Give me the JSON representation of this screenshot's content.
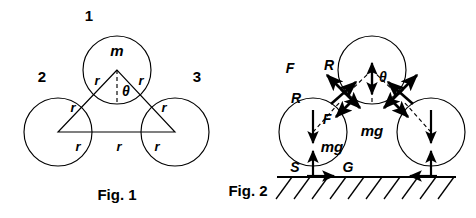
{
  "page": {
    "width": 476,
    "height": 218,
    "background": "#ffffff",
    "ink": "#000000"
  },
  "figure1": {
    "caption": "Fig. 1",
    "circle_labels": {
      "top": "1",
      "left": "2",
      "right": "3"
    },
    "mass_label": "m",
    "angle_label": "θ",
    "radius_labels": {
      "upper_left": "r",
      "upper_right": "r",
      "left_side": "r",
      "right_side": "r",
      "base_left": "r",
      "base_mid": "r",
      "base_right": "r"
    },
    "geometry": {
      "circle_radius": 34,
      "top_circle_center": [
        117,
        70
      ],
      "left_circle_center": [
        58,
        132
      ],
      "right_circle_center": [
        175,
        132
      ],
      "triangle_vertices": [
        [
          117,
          70
        ],
        [
          58,
          132
        ],
        [
          175,
          132
        ]
      ]
    }
  },
  "figure2": {
    "caption": "Fig. 2",
    "angle_label": "θ",
    "force_labels": {
      "friction_outer": "F",
      "reaction_outer": "R",
      "reaction_inner": "R",
      "friction_inner": "F",
      "weight_top": "mg",
      "weight_left": "mg",
      "normal_ground": "S",
      "ground_friction": "G"
    },
    "geometry": {
      "circle_radius": 34,
      "top_circle_center": [
        372,
        70
      ],
      "left_circle_center": [
        313,
        132
      ],
      "right_circle_center": [
        431,
        132
      ],
      "ground_line_y": 177,
      "ground_x_start": 277,
      "ground_x_end": 456
    }
  }
}
